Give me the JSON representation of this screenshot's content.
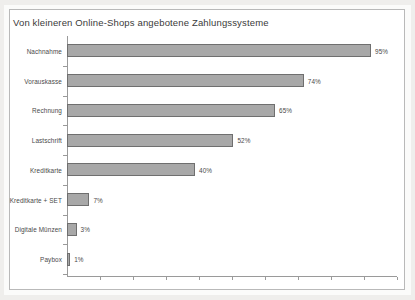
{
  "chart_data": {
    "type": "bar",
    "orientation": "horizontal",
    "title": "Von kleineren Online-Shops angebotene Zahlungssysteme",
    "xlabel": "",
    "ylabel": "",
    "xlim": [
      0,
      100
    ],
    "grid": false,
    "legend": false,
    "value_suffix": "%",
    "categories": [
      "Nachnahme",
      "Vorauskasse",
      "Rechnung",
      "Lastschrift",
      "Kreditkarte",
      "Kreditkarte + SET",
      "Digitale Münzen",
      "Paybox"
    ],
    "values": [
      95,
      74,
      65,
      52,
      40,
      7,
      3,
      1
    ],
    "value_labels": [
      "95%",
      "74%",
      "65%",
      "52%",
      "40%",
      "7%",
      "3%",
      "1%"
    ],
    "bar_fill": "#a8a8a8",
    "bar_stroke": "#6f6f6f",
    "axis_color": "#9a9a9a",
    "frame_color": "#b9b9b9",
    "text_color": "#4a4a4a",
    "background": "#ffffff"
  },
  "axis": {
    "x_tick_count": 10
  }
}
